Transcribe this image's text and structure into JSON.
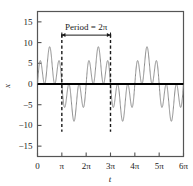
{
  "chart_data": {
    "type": "line",
    "title": "",
    "subtitle": "",
    "xlabel": "t",
    "ylabel": "x",
    "xlim": [
      0,
      18.8495559
    ],
    "ylim": [
      -17.5,
      17.5
    ],
    "grid": false,
    "legend": "none",
    "x_tick_values": [
      0,
      3.14159265,
      6.28318531,
      9.42477796,
      12.5663706,
      15.7079633,
      18.8495559
    ],
    "x_tick_labels": [
      "0",
      "π",
      "2π",
      "3π",
      "4π",
      "5π",
      "6π"
    ],
    "y_tick_values": [
      -15,
      -10,
      -5,
      0,
      5,
      10,
      15
    ],
    "y_tick_labels": [
      "−15",
      "−10",
      "−5",
      "0",
      "5",
      "10",
      "15"
    ],
    "series": [
      {
        "name": "x(t)",
        "color": "#8c8c8c",
        "description": "Superposition of harmonics, periodic with period 2π",
        "terms": [
          {
            "amplitude": 5,
            "frequency": 1,
            "phase": 0
          },
          {
            "amplitude": 4,
            "frequency": 5,
            "phase": 0
          }
        ],
        "peak_value": 9,
        "trough_value": -9,
        "period": 6.28318531
      }
    ],
    "annotations": [
      {
        "name": "period-label",
        "text": "Period = 2π",
        "x_start": 3.14159265,
        "x_end": 9.42477796,
        "y": 11.8,
        "style": "double-headed-arrow"
      },
      {
        "name": "period-marker-left",
        "text": "",
        "x": 3.14159265,
        "style": "dashed-vertical"
      },
      {
        "name": "period-marker-right",
        "text": "",
        "x": 9.42477796,
        "style": "dashed-vertical"
      }
    ],
    "zero_line": {
      "y": 0,
      "color": "#000000",
      "width": 2
    }
  },
  "axes": {
    "x_axis_title": "t",
    "y_axis_title": "x"
  },
  "colors": {
    "curve": "#8c8c8c",
    "frame": "#555555",
    "text": "#1a1a1a",
    "zero_line": "#000000",
    "dashed": "#1a1a1a",
    "background": "#ffffff"
  }
}
